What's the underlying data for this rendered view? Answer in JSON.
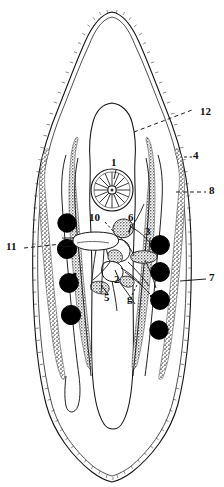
{
  "figure": {
    "kind": "biological-line-diagram",
    "background_color": "#ffffff",
    "ink_color": "#111111",
    "fill_organ_color": "#000000",
    "stipple_color": "#4a4a4a",
    "width": 224,
    "height": 487
  },
  "labels": [
    {
      "id": "label-1",
      "text": "1",
      "x": 114,
      "y": 164,
      "size": 11,
      "side": "center"
    },
    {
      "id": "label-2",
      "text": "2",
      "x": 117,
      "y": 281,
      "size": 11,
      "side": "center"
    },
    {
      "id": "label-3",
      "text": "3",
      "x": 148,
      "y": 233,
      "size": 11,
      "side": "center"
    },
    {
      "id": "label-4",
      "text": "4",
      "x": 196,
      "y": 157,
      "size": 11,
      "side": "right"
    },
    {
      "id": "label-5",
      "text": "5",
      "x": 107,
      "y": 299,
      "size": 11,
      "side": "center"
    },
    {
      "id": "label-6",
      "text": "6",
      "x": 131,
      "y": 219,
      "size": 11,
      "side": "center"
    },
    {
      "id": "label-7",
      "text": "7",
      "x": 212,
      "y": 279,
      "size": 11,
      "side": "right"
    },
    {
      "id": "label-8",
      "text": "8",
      "x": 212,
      "y": 192,
      "size": 11,
      "side": "right"
    },
    {
      "id": "label-10",
      "text": "10",
      "x": 95,
      "y": 219,
      "size": 11,
      "side": "center"
    },
    {
      "id": "label-11",
      "text": "11",
      "x": 11,
      "y": 248,
      "size": 11,
      "side": "left"
    },
    {
      "id": "label-12",
      "text": "12",
      "x": 203,
      "y": 113,
      "size": 11,
      "side": "right"
    },
    {
      "id": "label-g",
      "text": "g",
      "x": 130,
      "y": 300,
      "size": 11,
      "side": "center"
    }
  ],
  "structures": {
    "body_outline": "spined tegument double contour, lanceolate body, pointed anterior apex and pointed posterior end",
    "inner_sac": "median elongate sac (uterus/gut) with rounded dome apex",
    "radial_organ": "circular organ with radial spokes near label 1",
    "dark_organs_left_count": 4,
    "dark_organs_right_count": 4,
    "vitellaria": "two stippled granular follicle chains flanking the midline on each side"
  },
  "leaders": {
    "dashed": [
      "12",
      "8",
      "11"
    ],
    "solid": [
      "1",
      "2",
      "3",
      "4",
      "5",
      "6",
      "7",
      "10",
      "g"
    ]
  }
}
